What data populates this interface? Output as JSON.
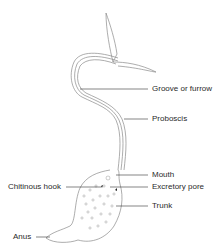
{
  "diagram": {
    "stroke_color": "#8a8a8a",
    "text_color": "#2a2a2a",
    "labels": [
      {
        "id": "groove",
        "text": "Groove or furrow",
        "x": 152,
        "y": 84
      },
      {
        "id": "proboscis",
        "text": "Proboscis",
        "x": 152,
        "y": 114
      },
      {
        "id": "mouth",
        "text": "Mouth",
        "x": 152,
        "y": 170
      },
      {
        "id": "excretory_pore",
        "text": "Excretory pore",
        "x": 152,
        "y": 182
      },
      {
        "id": "trunk",
        "text": "Trunk",
        "x": 152,
        "y": 201
      },
      {
        "id": "chitinous_hook",
        "text": "Chitinous hook",
        "x": 8,
        "y": 182
      },
      {
        "id": "anus",
        "text": "Anus",
        "x": 13,
        "y": 232
      }
    ]
  }
}
